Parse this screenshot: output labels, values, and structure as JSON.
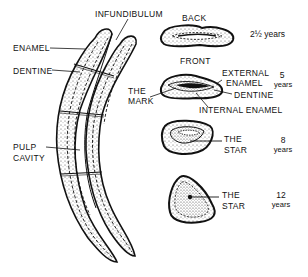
{
  "figure": {
    "longitudinal_labels": {
      "infundibulum": "INFUNDIBULUM",
      "enamel": "ENAMEL",
      "dentine": "DENTINE",
      "pulp_line1": "PULP",
      "pulp_line2": "CAVITY"
    },
    "cross_sections": [
      {
        "age_main": "2½",
        "age_unit": "years",
        "labels": {
          "top": "BACK",
          "bottom": "FRONT"
        }
      },
      {
        "age_main": "5",
        "age_unit": "years",
        "labels": {
          "external_1": "EXTERNAL",
          "external_2": "ENAMEL",
          "mark_1": "THE",
          "mark_2": "MARK",
          "dentine": "DENTINE",
          "internal": "INTERNAL ENAMEL"
        }
      },
      {
        "age_main": "8",
        "age_unit": "years",
        "labels": {
          "star_1": "THE",
          "star_2": "STAR"
        }
      },
      {
        "age_main": "12",
        "age_unit": "years",
        "labels": {
          "star_1": "THE",
          "star_2": "STAR"
        }
      }
    ],
    "colors": {
      "ink": "#111111",
      "stipple": "#8a8a8a",
      "background": "#ffffff"
    }
  }
}
